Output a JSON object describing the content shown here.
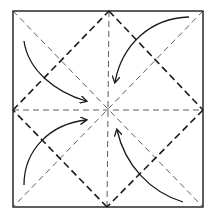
{
  "diagram": {
    "type": "origami-fold-diagram",
    "colors": {
      "line": "#1a1a1a",
      "background": "#ffffff"
    },
    "square": {
      "x1": 13,
      "y1": 11,
      "x2": 203,
      "y2": 207
    },
    "center": {
      "x": 107,
      "y": 110
    },
    "arrows": [
      {
        "from": "top-left",
        "to": "center"
      },
      {
        "from": "top-right",
        "to": "center"
      },
      {
        "from": "bottom-left",
        "to": "center"
      },
      {
        "from": "bottom-right",
        "to": "center"
      }
    ]
  }
}
